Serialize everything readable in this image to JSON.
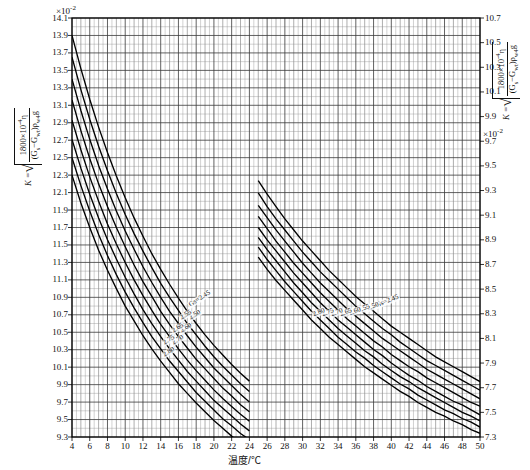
{
  "chart_data": {
    "type": "line",
    "title": "",
    "xlabel": "温度/℃",
    "ylabel_left": "K = √(1800×10⁻⁴·η / ((Gs−Gwt)·ρw4·g))",
    "ylabel_right": "K = √(1800×10⁻⁴·η / ((Gs−Gwt)·ρw4·g))",
    "x": [
      4,
      6,
      8,
      10,
      12,
      14,
      16,
      18,
      20,
      22,
      24,
      26,
      28,
      30,
      32,
      34,
      36,
      38,
      40,
      42,
      44,
      46,
      48,
      50
    ],
    "xlim": [
      4,
      50
    ],
    "xtick_step": 2,
    "xminor_step": 1,
    "left_axis": {
      "exponent": "×10⁻²",
      "ticks": [
        14.1,
        13.9,
        13.7,
        13.5,
        13.3,
        13.1,
        12.9,
        12.7,
        12.5,
        12.3,
        12.1,
        11.9,
        11.7,
        11.5,
        11.3,
        11.1,
        10.9,
        10.7,
        10.5,
        10.3,
        10.1,
        9.9,
        9.7,
        9.5,
        9.3
      ],
      "ylim": [
        9.3,
        14.1
      ],
      "step": 0.2
    },
    "right_axis": {
      "exponent": "×10⁻²",
      "ticks": [
        10.7,
        10.5,
        10.3,
        10.1,
        9.9,
        9.7,
        9.5,
        9.3,
        9.1,
        8.9,
        8.7,
        8.5,
        8.3,
        8.1,
        7.9,
        7.7,
        7.5,
        7.3
      ],
      "ylim": [
        7.3,
        10.7
      ],
      "step": 0.2
    },
    "grid": true,
    "legend_position": "inline-on-curves",
    "group_left": {
      "note": "left fan of curves, x from 4 to 24.5 °C, values on left axis (×10⁻²)",
      "series": [
        {
          "name": "Gs=2.45",
          "values": [
            13.9,
            13.52,
            13.17,
            12.85,
            12.56,
            12.29,
            12.04,
            11.81,
            11.6,
            11.4,
            11.22,
            11.05,
            10.89,
            10.74,
            10.6,
            10.47,
            10.35,
            10.24,
            10.13,
            10.03,
            9.94
          ]
        },
        {
          "name": "2.50",
          "values": [
            13.65,
            13.28,
            12.94,
            12.63,
            12.35,
            12.09,
            11.85,
            11.63,
            11.43,
            11.24,
            11.06,
            10.9,
            10.75,
            10.6,
            10.47,
            10.34,
            10.22,
            10.11,
            10.01,
            9.91,
            9.82
          ]
        },
        {
          "name": "2.55",
          "values": [
            13.4,
            13.04,
            12.71,
            12.41,
            12.14,
            11.89,
            11.66,
            11.45,
            11.25,
            11.07,
            10.9,
            10.74,
            10.6,
            10.46,
            10.33,
            10.21,
            10.09,
            9.99,
            9.89,
            9.79,
            9.7
          ]
        },
        {
          "name": "2.60",
          "values": [
            13.16,
            12.81,
            12.49,
            12.2,
            11.94,
            11.7,
            11.48,
            11.27,
            11.08,
            10.91,
            10.74,
            10.59,
            10.45,
            10.32,
            10.19,
            10.08,
            9.97,
            9.86,
            9.77,
            9.67,
            9.59
          ]
        },
        {
          "name": "2.65",
          "values": [
            12.93,
            12.59,
            12.28,
            12.0,
            11.74,
            11.51,
            11.3,
            11.1,
            10.92,
            10.75,
            10.59,
            10.45,
            10.31,
            10.18,
            10.06,
            9.95,
            9.84,
            9.74,
            9.65,
            9.56,
            9.48
          ]
        },
        {
          "name": "2.70",
          "values": [
            12.71,
            12.38,
            12.08,
            11.81,
            11.56,
            11.34,
            11.13,
            10.94,
            10.76,
            10.6,
            10.45,
            10.31,
            10.18,
            10.05,
            9.94,
            9.83,
            9.72,
            9.63,
            9.54,
            9.45,
            9.37
          ]
        },
        {
          "name": "2.75",
          "values": [
            12.5,
            12.18,
            11.89,
            11.62,
            11.38,
            11.16,
            10.96,
            10.78,
            10.61,
            10.45,
            10.31,
            10.17,
            10.05,
            9.93,
            9.81,
            9.71,
            9.61,
            9.51,
            9.43,
            9.34,
            9.27
          ]
        },
        {
          "name": "2.80",
          "values": [
            12.3,
            11.98,
            11.7,
            11.44,
            11.21,
            11.0,
            10.8,
            10.63,
            10.46,
            10.31,
            10.17,
            10.04,
            9.91,
            9.8,
            9.69,
            9.59,
            9.49,
            9.4,
            9.31,
            9.23,
            9.15
          ]
        }
      ],
      "x": [
        4,
        5,
        6,
        7,
        8,
        9,
        10,
        11,
        12,
        13,
        14,
        15,
        16,
        17,
        18,
        19,
        20,
        21,
        22,
        23,
        24
      ]
    },
    "group_right": {
      "note": "right fan of curves, x from 24.5 to 50 °C, values on right axis (×10⁻²)",
      "series": [
        {
          "name": "Gs=2.45",
          "values": [
            9.38,
            9.27,
            9.17,
            9.07,
            8.98,
            8.89,
            8.81,
            8.73,
            8.65,
            8.58,
            8.51,
            8.44,
            8.38,
            8.32,
            8.26,
            8.2,
            8.15,
            8.1,
            8.05,
            8.0,
            7.95,
            7.91,
            7.87,
            7.83,
            7.79,
            7.75
          ]
        },
        {
          "name": "2.50",
          "values": [
            9.28,
            9.17,
            9.07,
            8.98,
            8.89,
            8.8,
            8.72,
            8.64,
            8.57,
            8.5,
            8.43,
            8.36,
            8.3,
            8.24,
            8.18,
            8.13,
            8.07,
            8.02,
            7.97,
            7.92,
            7.88,
            7.84,
            7.8,
            7.76,
            7.72,
            7.68
          ]
        },
        {
          "name": "2.55",
          "values": [
            9.18,
            9.08,
            8.98,
            8.89,
            8.8,
            8.71,
            8.63,
            8.55,
            8.48,
            8.41,
            8.34,
            8.28,
            8.22,
            8.16,
            8.1,
            8.05,
            8.0,
            7.95,
            7.9,
            7.85,
            7.81,
            7.77,
            7.73,
            7.69,
            7.65,
            7.61
          ]
        },
        {
          "name": "2.60",
          "values": [
            9.09,
            8.99,
            8.89,
            8.8,
            8.71,
            8.63,
            8.55,
            8.47,
            8.4,
            8.33,
            8.26,
            8.2,
            8.14,
            8.08,
            8.03,
            7.97,
            7.92,
            7.87,
            7.83,
            7.78,
            7.74,
            7.7,
            7.66,
            7.62,
            7.58,
            7.55
          ]
        },
        {
          "name": "2.65",
          "values": [
            9.0,
            8.9,
            8.81,
            8.72,
            8.63,
            8.55,
            8.47,
            8.39,
            8.32,
            8.25,
            8.19,
            8.13,
            8.07,
            8.01,
            7.96,
            7.9,
            7.85,
            7.8,
            7.76,
            7.71,
            7.67,
            7.63,
            7.59,
            7.56,
            7.52,
            7.48
          ]
        },
        {
          "name": "2.70",
          "values": [
            8.92,
            8.82,
            8.73,
            8.64,
            8.55,
            8.47,
            8.39,
            8.32,
            8.25,
            8.18,
            8.12,
            8.06,
            8.0,
            7.95,
            7.89,
            7.84,
            7.79,
            7.75,
            7.7,
            7.66,
            7.62,
            7.58,
            7.54,
            7.5,
            7.47,
            7.43
          ]
        },
        {
          "name": "2.75",
          "values": [
            8.84,
            8.74,
            8.65,
            8.56,
            8.48,
            8.4,
            8.32,
            8.25,
            8.18,
            8.11,
            8.05,
            7.99,
            7.94,
            7.88,
            7.83,
            7.78,
            7.73,
            7.69,
            7.64,
            7.6,
            7.56,
            7.52,
            7.49,
            7.45,
            7.42,
            7.38
          ]
        },
        {
          "name": "2.80",
          "values": [
            8.76,
            8.66,
            8.57,
            8.49,
            8.41,
            8.33,
            8.25,
            8.18,
            8.11,
            8.05,
            7.99,
            7.93,
            7.87,
            7.82,
            7.77,
            7.72,
            7.67,
            7.63,
            7.58,
            7.54,
            7.5,
            7.47,
            7.43,
            7.4,
            7.36,
            7.33
          ]
        }
      ],
      "x": [
        25,
        26,
        27,
        28,
        29,
        30,
        31,
        32,
        33,
        34,
        35,
        36,
        37,
        38,
        39,
        40,
        41,
        42,
        43,
        44,
        45,
        46,
        47,
        48,
        49,
        50
      ]
    }
  },
  "axes": {
    "x_title": "温度/℃",
    "x_ticks": [
      "4",
      "6",
      "8",
      "10",
      "12",
      "14",
      "16",
      "18",
      "20",
      "22",
      "24",
      "26",
      "28",
      "30",
      "32",
      "34",
      "36",
      "38",
      "40",
      "42",
      "44",
      "46",
      "48",
      "50"
    ],
    "left_exponent": "×10",
    "left_exponent_sup": "-2",
    "right_exponent": "×10",
    "right_exponent_sup": "-2",
    "left_ticks": [
      "14.1",
      "13.9",
      "13.7",
      "13.5",
      "13.3",
      "13.1",
      "12.9",
      "12.7",
      "12.5",
      "12.3",
      "12.1",
      "11.9",
      "11.7",
      "11.5",
      "11.3",
      "11.1",
      "10.9",
      "10.7",
      "10.5",
      "10.3",
      "10.1",
      "9.9",
      "9.7",
      "9.5",
      "9.3"
    ],
    "right_ticks": [
      "10.7",
      "10.5",
      "10.3",
      "10.1",
      "9.9",
      "9.7",
      "9.5",
      "9.3",
      "9.1",
      "8.9",
      "8.7",
      "8.5",
      "8.3",
      "8.1",
      "7.9",
      "7.7",
      "7.5",
      "7.3"
    ]
  },
  "formula": {
    "k_equals": "K =",
    "numerator": "1800×10",
    "numerator_sup": "-4",
    "numerator_eta": "η",
    "denominator_open": "(G",
    "denominator_s": "s",
    "denominator_minus": "−G",
    "denominator_wt": "wt",
    "denominator_close": ")ρ",
    "denominator_rho": "w4",
    "denominator_g": "g"
  },
  "curve_labels": {
    "left": [
      "Gs=2.45",
      "2.50",
      "2.55",
      "2.60",
      "2.65",
      "2.70",
      "2.75",
      "2.80"
    ],
    "right": [
      "Gs=2.45",
      "2.50",
      "2.55",
      "2.60",
      "2.65",
      "2.70",
      "2.75",
      "2.80"
    ]
  }
}
